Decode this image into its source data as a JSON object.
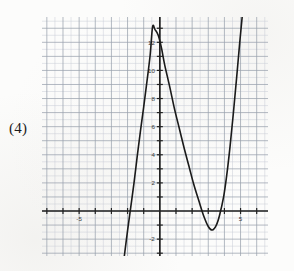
{
  "problem": {
    "number_label": "(4)"
  },
  "chart_data": {
    "type": "line",
    "title": "",
    "xlabel": "",
    "ylabel": "",
    "xlim": [
      -7.3,
      6.7
    ],
    "ylim": [
      -3.2,
      13.8
    ],
    "grid": true,
    "grid_minor_spacing": 0.5,
    "grid_major_spacing": 1,
    "legend": "none",
    "axes": {
      "x_axis_y_value": 0,
      "y_axis_x_value": 0,
      "x_tick_labels": [
        {
          "value": -5,
          "text": "-5"
        },
        {
          "value": 5,
          "text": "5"
        }
      ],
      "y_tick_labels": [
        {
          "value": -2,
          "text": "-2"
        },
        {
          "value": 2,
          "text": "2"
        },
        {
          "value": 4,
          "text": "4"
        },
        {
          "value": 6,
          "text": "6"
        },
        {
          "value": 8,
          "text": "8"
        },
        {
          "value": 10,
          "text": "10"
        },
        {
          "value": 12,
          "text": "12"
        }
      ],
      "x_tick_values": [
        -7,
        -6,
        -5,
        -4,
        -3,
        -2,
        -1,
        1,
        2,
        3,
        4,
        5,
        6
      ],
      "y_tick_values": [
        -3,
        -2,
        -1,
        1,
        2,
        3,
        4,
        5,
        6,
        7,
        8,
        9,
        10,
        11,
        12,
        13
      ]
    },
    "series": [
      {
        "name": "cubic curve",
        "roots_approx": [
          -1.6,
          2.45,
          3.95
        ],
        "local_max": {
          "x": -0.45,
          "y": 13.1
        },
        "local_min": {
          "x": 3.25,
          "y": -1.35
        },
        "points": [
          {
            "x": -2.2,
            "y": -3.2
          },
          {
            "x": -2.0,
            "y": -1.4
          },
          {
            "x": -1.8,
            "y": 0.3
          },
          {
            "x": -1.6,
            "y": 2.0
          },
          {
            "x": -1.4,
            "y": 3.9
          },
          {
            "x": -1.2,
            "y": 5.7
          },
          {
            "x": -1.0,
            "y": 7.4
          },
          {
            "x": -0.8,
            "y": 9.2
          },
          {
            "x": -0.6,
            "y": 11.1
          },
          {
            "x": -0.45,
            "y": 13.1
          },
          {
            "x": -0.3,
            "y": 12.9
          },
          {
            "x": -0.1,
            "y": 12.5
          },
          {
            "x": 0.1,
            "y": 11.6
          },
          {
            "x": 0.3,
            "y": 10.4
          },
          {
            "x": 0.6,
            "y": 8.9
          },
          {
            "x": 0.9,
            "y": 7.3
          },
          {
            "x": 1.2,
            "y": 5.9
          },
          {
            "x": 1.5,
            "y": 4.5
          },
          {
            "x": 1.8,
            "y": 3.2
          },
          {
            "x": 2.1,
            "y": 1.9
          },
          {
            "x": 2.45,
            "y": 0.6
          },
          {
            "x": 2.7,
            "y": -0.3
          },
          {
            "x": 3.0,
            "y": -1.1
          },
          {
            "x": 3.25,
            "y": -1.35
          },
          {
            "x": 3.5,
            "y": -1.0
          },
          {
            "x": 3.7,
            "y": -0.3
          },
          {
            "x": 3.95,
            "y": 1.0
          },
          {
            "x": 4.15,
            "y": 2.6
          },
          {
            "x": 4.35,
            "y": 4.6
          },
          {
            "x": 4.55,
            "y": 6.9
          },
          {
            "x": 4.75,
            "y": 9.4
          },
          {
            "x": 4.95,
            "y": 12.0
          },
          {
            "x": 5.1,
            "y": 13.8
          }
        ]
      }
    ],
    "colors": {
      "curve": "#1a1a1a",
      "axis": "#222222",
      "grid_minor": "#c9cdd6",
      "grid_major": "#9aa1ad",
      "background": "#fcfcfb"
    }
  }
}
